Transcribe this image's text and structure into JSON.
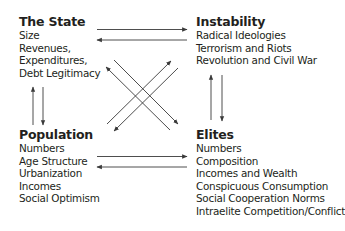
{
  "nodes": {
    "state": {
      "title": "The State",
      "items": [
        "Size",
        "Revenues,",
        "Expenditures,",
        "Debt Legitimacy"
      ]
    },
    "instability": {
      "title": "Instability",
      "items": [
        "Radical Ideologies",
        "Terrorism and Riots",
        "Revolution and Civil War"
      ]
    },
    "population": {
      "title": "Population",
      "items": [
        "Numbers",
        "Age Structure",
        "Urbanization",
        "Incomes",
        "Social Optimism"
      ]
    },
    "elites": {
      "title": "Elites",
      "items": [
        "Numbers",
        "Composition",
        "Incomes and Wealth",
        "Conspicuous Consumption",
        "Social Cooperation Norms",
        "Intraelite Competition/Conflict"
      ]
    }
  },
  "edges": [
    {
      "from": "state",
      "to": "instability"
    },
    {
      "from": "instability",
      "to": "state"
    },
    {
      "from": "state",
      "to": "population"
    },
    {
      "from": "population",
      "to": "state"
    },
    {
      "from": "instability",
      "to": "elites"
    },
    {
      "from": "elites",
      "to": "instability"
    },
    {
      "from": "population",
      "to": "elites"
    },
    {
      "from": "elites",
      "to": "population"
    },
    {
      "from": "state",
      "to": "elites"
    },
    {
      "from": "elites",
      "to": "state"
    },
    {
      "from": "population",
      "to": "instability"
    },
    {
      "from": "instability",
      "to": "population"
    }
  ],
  "colors": {
    "text": "#231f20",
    "arrow": "#3a3a3a",
    "background": "#ffffff"
  }
}
